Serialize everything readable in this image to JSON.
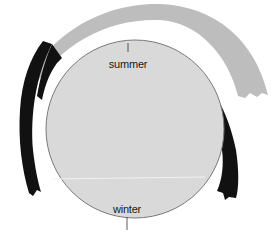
{
  "diagram": {
    "labels": {
      "top": "summer",
      "bottom": "winter"
    },
    "colors": {
      "background": "#ffffff",
      "disc_fill": "#d9d9d9",
      "disc_stroke": "#7a7a7a",
      "outer_arc": "#bdbdbd",
      "dark_arcs": "#111111",
      "divider_line": "#f2f2f2"
    }
  }
}
